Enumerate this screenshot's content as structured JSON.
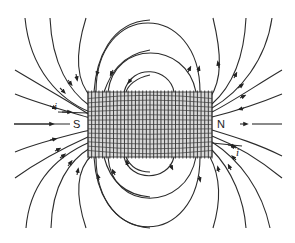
{
  "diagram": {
    "type": "solenoid-magnetic-field",
    "labels": {
      "south": "S",
      "north": "N",
      "current_left": "i",
      "current_right": "i"
    },
    "colors": {
      "background": "#ffffff",
      "lines": "#2b2b2b",
      "coil": "#2a2a2a"
    },
    "solenoid": {
      "x": 88,
      "y": 92,
      "width": 124,
      "height": 65,
      "turns": 34
    },
    "field_line_count": 26
  }
}
